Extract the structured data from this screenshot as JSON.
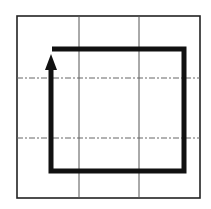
{
  "diagram": {
    "type": "grid-path",
    "outer_box": {
      "x": 17,
      "y": 16,
      "width": 183,
      "height": 182
    },
    "grid": {
      "vertical_lines_x": [
        79,
        139
      ],
      "horizontal_lines_y": [
        78,
        138
      ],
      "vertical_style": "solid",
      "horizontal_style": "dashed"
    },
    "path": {
      "points": [
        [
          52,
          49
        ],
        [
          184,
          49
        ],
        [
          184,
          171
        ],
        [
          51,
          171
        ],
        [
          51,
          62
        ]
      ],
      "arrow_head": "up",
      "arrow_tip": [
        51,
        55
      ],
      "stroke_color": "#111111",
      "stroke_width": 5
    },
    "colors": {
      "line": "#222222",
      "grid": "#555555",
      "background": "#ffffff"
    }
  }
}
